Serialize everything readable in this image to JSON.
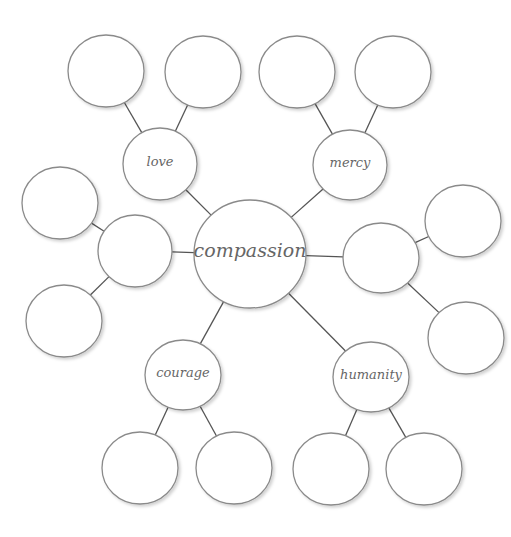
{
  "diagram": {
    "type": "concept-web",
    "colors": {
      "node_fill": "#ffffff",
      "node_stroke": "#8a8a8a",
      "edge": "#555555",
      "text": "#666666"
    },
    "center": {
      "id": "compassion",
      "label": "compassion",
      "cx": 250,
      "cy": 254,
      "rx": 56,
      "ry": 54
    },
    "branches": [
      {
        "id": "love",
        "label": "love",
        "cx": 160,
        "cy": 164,
        "rx": 37,
        "ry": 36,
        "leaves": [
          {
            "cx": 106,
            "cy": 71
          },
          {
            "cx": 203,
            "cy": 72
          }
        ]
      },
      {
        "id": "mercy",
        "label": "mercy",
        "cx": 350,
        "cy": 165,
        "rx": 37,
        "ry": 35,
        "leaves": [
          {
            "cx": 297,
            "cy": 72
          },
          {
            "cx": 393,
            "cy": 72
          }
        ]
      },
      {
        "id": "left",
        "label": "",
        "cx": 135,
        "cy": 251,
        "rx": 37,
        "ry": 36,
        "leaves": [
          {
            "cx": 60,
            "cy": 203
          },
          {
            "cx": 64,
            "cy": 321
          }
        ]
      },
      {
        "id": "right",
        "label": "",
        "cx": 381,
        "cy": 258,
        "rx": 38,
        "ry": 35,
        "leaves": [
          {
            "cx": 463,
            "cy": 221
          },
          {
            "cx": 466,
            "cy": 338
          }
        ]
      },
      {
        "id": "courage",
        "label": "courage",
        "cx": 183,
        "cy": 375,
        "rx": 38,
        "ry": 35,
        "leaves": [
          {
            "cx": 140,
            "cy": 468
          },
          {
            "cx": 234,
            "cy": 468
          }
        ]
      },
      {
        "id": "humanity",
        "label": "humanity",
        "cx": 371,
        "cy": 377,
        "rx": 38,
        "ry": 35,
        "leaves": [
          {
            "cx": 331,
            "cy": 469
          },
          {
            "cx": 424,
            "cy": 469
          }
        ]
      }
    ],
    "leaf_size": {
      "rx": 38,
      "ry": 36
    }
  }
}
